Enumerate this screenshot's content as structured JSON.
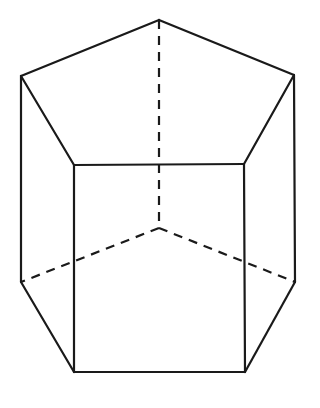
{
  "figure": {
    "type": "pentagonal-prism",
    "stroke_color": "#1a1a1a",
    "background": "#ffffff",
    "vertices": {
      "top_back": [
        159,
        20
      ],
      "top_left": [
        21,
        76
      ],
      "top_right": [
        294,
        75
      ],
      "top_front_left": [
        74,
        165
      ],
      "top_front_right": [
        244,
        164
      ],
      "bottom_back": [
        159,
        228
      ],
      "bottom_left": [
        21,
        282
      ],
      "bottom_right": [
        295,
        282
      ],
      "bottom_front_left": [
        74,
        372
      ],
      "bottom_front_right": [
        245,
        372
      ]
    },
    "visible_edges": [
      [
        "top_back",
        "top_left"
      ],
      [
        "top_back",
        "top_right"
      ],
      [
        "top_left",
        "top_front_left"
      ],
      [
        "top_right",
        "top_front_right"
      ],
      [
        "top_front_left",
        "top_front_right"
      ],
      [
        "top_left",
        "bottom_left"
      ],
      [
        "top_right",
        "bottom_right"
      ],
      [
        "top_front_left",
        "bottom_front_left"
      ],
      [
        "top_front_right",
        "bottom_front_right"
      ],
      [
        "bottom_left",
        "bottom_front_left"
      ],
      [
        "bottom_right",
        "bottom_front_right"
      ],
      [
        "bottom_front_left",
        "bottom_front_right"
      ]
    ],
    "hidden_edges": [
      [
        "top_back",
        "bottom_back"
      ],
      [
        "bottom_back",
        "bottom_left"
      ],
      [
        "bottom_back",
        "bottom_right"
      ]
    ]
  }
}
